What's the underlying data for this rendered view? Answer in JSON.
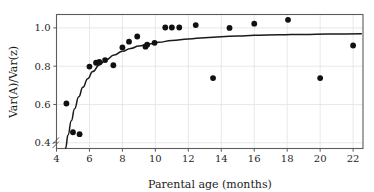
{
  "chart_data": {
    "type": "scatter",
    "title": "",
    "xlabel": "Parental age (months)",
    "ylabel": "Var(A)/Var(z)",
    "xlim": [
      4,
      22.6
    ],
    "ylim": [
      0.37,
      1.07
    ],
    "xticks": [
      4,
      6,
      8,
      10,
      12,
      14,
      16,
      18,
      20,
      22
    ],
    "xtick_labels": [
      "4",
      "6",
      "8",
      "10",
      "12",
      "14",
      "16",
      "18",
      "20",
      "22"
    ],
    "yticks": [
      0.4,
      0.6,
      0.8,
      1.0
    ],
    "ytick_labels": [
      "0.4",
      "0.6",
      "0.8",
      "1.0"
    ],
    "grid": true,
    "legend": null,
    "axis_break": "y-axis broken below 0.4",
    "point_color": "#111111",
    "curve_color": "#1a1a1a",
    "grid_color": "#e2e2e2",
    "frame_color": "#5c5c5c",
    "points": [
      {
        "x": 4.6,
        "y": 0.605
      },
      {
        "x": 5.0,
        "y": 0.455
      },
      {
        "x": 5.4,
        "y": 0.445
      },
      {
        "x": 6.0,
        "y": 0.798
      },
      {
        "x": 6.4,
        "y": 0.818
      },
      {
        "x": 6.6,
        "y": 0.822
      },
      {
        "x": 6.95,
        "y": 0.832
      },
      {
        "x": 7.45,
        "y": 0.805
      },
      {
        "x": 8.0,
        "y": 0.898
      },
      {
        "x": 8.4,
        "y": 0.928
      },
      {
        "x": 8.9,
        "y": 0.955
      },
      {
        "x": 9.4,
        "y": 0.902
      },
      {
        "x": 9.5,
        "y": 0.912
      },
      {
        "x": 9.95,
        "y": 0.922
      },
      {
        "x": 10.6,
        "y": 1.002
      },
      {
        "x": 11.0,
        "y": 1.002
      },
      {
        "x": 11.45,
        "y": 1.002
      },
      {
        "x": 12.45,
        "y": 1.015
      },
      {
        "x": 13.5,
        "y": 0.738
      },
      {
        "x": 14.5,
        "y": 1.0
      },
      {
        "x": 16.0,
        "y": 1.022
      },
      {
        "x": 18.05,
        "y": 1.042
      },
      {
        "x": 20.0,
        "y": 0.738
      },
      {
        "x": 22.0,
        "y": 0.908
      }
    ],
    "fit_curve": {
      "description": "monotonic saturating fit approaching ~0.97",
      "points": [
        {
          "x": 4.55,
          "y": 0.372
        },
        {
          "x": 4.7,
          "y": 0.44
        },
        {
          "x": 4.9,
          "y": 0.515
        },
        {
          "x": 5.1,
          "y": 0.578
        },
        {
          "x": 5.35,
          "y": 0.64
        },
        {
          "x": 5.6,
          "y": 0.69
        },
        {
          "x": 5.9,
          "y": 0.735
        },
        {
          "x": 6.2,
          "y": 0.772
        },
        {
          "x": 6.6,
          "y": 0.806
        },
        {
          "x": 7.0,
          "y": 0.833
        },
        {
          "x": 7.5,
          "y": 0.858
        },
        {
          "x": 8.0,
          "y": 0.878
        },
        {
          "x": 8.5,
          "y": 0.893
        },
        {
          "x": 9.0,
          "y": 0.905
        },
        {
          "x": 9.6,
          "y": 0.916
        },
        {
          "x": 10.2,
          "y": 0.925
        },
        {
          "x": 11.0,
          "y": 0.934
        },
        {
          "x": 12.0,
          "y": 0.942
        },
        {
          "x": 13.0,
          "y": 0.949
        },
        {
          "x": 14.0,
          "y": 0.954
        },
        {
          "x": 15.0,
          "y": 0.958
        },
        {
          "x": 16.0,
          "y": 0.961
        },
        {
          "x": 17.5,
          "y": 0.964
        },
        {
          "x": 19.0,
          "y": 0.966
        },
        {
          "x": 20.5,
          "y": 0.968
        },
        {
          "x": 22.5,
          "y": 0.969
        }
      ]
    }
  }
}
